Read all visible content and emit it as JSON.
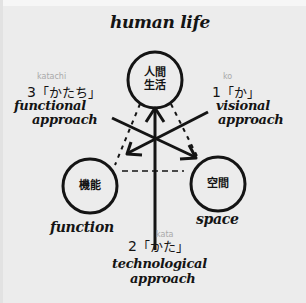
{
  "title": "human life",
  "nodes": {
    "top": {
      "kanji_line1": "人間",
      "kanji_line2": "生活"
    },
    "left": {
      "kanji": "機能",
      "caption": "function"
    },
    "right": {
      "kanji": "空間",
      "caption": "space"
    }
  },
  "approaches": {
    "visional": {
      "romaji": "ko",
      "number": "1",
      "kana": "「か」",
      "line1": "visional",
      "line2": "approach"
    },
    "technological": {
      "romaji": "kata",
      "number": "2",
      "kana": "「かた」",
      "line1": "technological",
      "line2": "approach"
    },
    "functional": {
      "romaji": "katachi",
      "number": "3",
      "kana": "「かたち」",
      "line1": "functional",
      "line2": "approach"
    }
  },
  "colors": {
    "background": "#ececec",
    "ink": "#141414",
    "romaji": "#a9a9a9"
  }
}
